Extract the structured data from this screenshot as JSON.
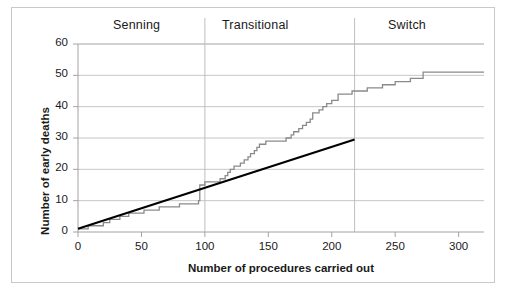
{
  "chart_data": {
    "type": "line",
    "title": "",
    "xlabel": "Number of procedures carried out",
    "ylabel": "Number of early deaths",
    "xlim": [
      0,
      320
    ],
    "ylim": [
      0,
      60
    ],
    "xticks": [
      0,
      50,
      100,
      150,
      200,
      250,
      300
    ],
    "yticks": [
      0,
      10,
      20,
      30,
      40,
      50,
      60
    ],
    "grid": "horizontal",
    "legend": "none",
    "regions": [
      {
        "label": "Senning",
        "x_start": 0,
        "x_end": 100,
        "label_x": 50
      },
      {
        "label": "Transitional",
        "x_start": 100,
        "x_end": 218,
        "label_x": 159
      },
      {
        "label": "Switch",
        "x_start": 218,
        "x_end": 320,
        "label_x": 269
      }
    ],
    "region_dividers": [
      100,
      218
    ],
    "series": [
      {
        "name": "Cumulative early deaths",
        "style": "step",
        "color": "#8a8a8a",
        "x": [
          0,
          4,
          8,
          14,
          20,
          22,
          25,
          28,
          33,
          36,
          40,
          44,
          48,
          52,
          56,
          60,
          64,
          68,
          72,
          76,
          80,
          84,
          88,
          92,
          95,
          96,
          100,
          104,
          108,
          112,
          116,
          118,
          120,
          123,
          126,
          128,
          131,
          134,
          136,
          139,
          141,
          143,
          146,
          148,
          150,
          155,
          160,
          164,
          168,
          170,
          174,
          177,
          180,
          183,
          185,
          187,
          190,
          193,
          196,
          200,
          205,
          210,
          213,
          216,
          218,
          222,
          228,
          234,
          240,
          246,
          250,
          256,
          262,
          268,
          272,
          276,
          285,
          295,
          305,
          315,
          320
        ],
        "y": [
          1,
          1,
          2,
          2,
          3,
          3,
          4,
          4,
          5,
          5,
          6,
          6,
          6,
          7,
          7,
          7,
          8,
          8,
          8,
          8,
          9,
          9,
          9,
          9,
          10,
          15,
          16,
          16,
          16,
          17,
          18,
          19,
          20,
          21,
          21,
          22,
          23,
          24,
          25,
          26,
          27,
          28,
          28,
          29,
          29,
          29,
          29,
          30,
          31,
          32,
          33,
          34,
          35,
          36,
          38,
          38,
          39,
          40,
          41,
          42,
          44,
          44,
          44,
          45,
          45,
          45,
          46,
          46,
          47,
          47,
          48,
          48,
          49,
          49,
          51,
          51,
          51,
          51,
          51,
          51,
          51
        ]
      },
      {
        "name": "Reference line",
        "style": "straight",
        "color": "#000000",
        "x": [
          0,
          218
        ],
        "y": [
          1,
          29.5
        ]
      }
    ]
  },
  "axes": {
    "y_label": "Number of early deaths",
    "x_label": "Number of procedures carried out",
    "y_tick_labels": [
      "60",
      "50",
      "40",
      "30",
      "20",
      "10",
      "0"
    ],
    "x_tick_labels": [
      "0",
      "50",
      "100",
      "150",
      "200",
      "250",
      "300"
    ]
  },
  "regions": {
    "senning": "Senning",
    "transitional": "Transitional",
    "switch": "Switch"
  },
  "colors": {
    "step_line": "#8a8a8a",
    "reference_line": "#000000",
    "gridline": "#b8b8b8",
    "axis": "#9a9a9a",
    "frame": "#c9c9c9",
    "text": "#1a1a1a"
  }
}
